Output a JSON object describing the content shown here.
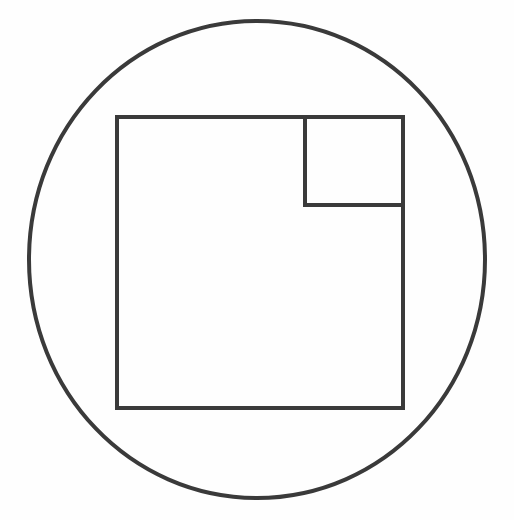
{
  "canvas": {
    "width": 514,
    "height": 520,
    "background_color": "#fefefe",
    "title": "Geometric line drawing: circle with inscribed squares"
  },
  "style": {
    "stroke_color": "#3a3a3a",
    "stroke_width": 4,
    "fill_color": "none",
    "interior_fill": "#fafafa"
  },
  "shapes": {
    "circle": {
      "name": "outer-circle",
      "type": "circle",
      "center_x": 257,
      "center_y": 259.5,
      "radius_x": 228,
      "radius_y": 238.5,
      "stroke_color": "#3a3a3a",
      "stroke_width": 4,
      "fill": "none",
      "path": "M 257 21 C 383 21 485 127 485 259.5 C 485 392 383 498 257 498 C 131 498 29 392 29 259.5 C 29 127 131 21 257 21 Z"
    },
    "large_square": {
      "name": "large-square",
      "type": "rect",
      "x": 117,
      "y": 117,
      "width": 286,
      "height": 291,
      "stroke_color": "#3a3a3a",
      "stroke_width": 4,
      "fill": "none"
    },
    "small_square": {
      "name": "small-square",
      "type": "rect",
      "x": 305,
      "y": 117,
      "width": 98,
      "height": 88,
      "stroke_color": "#3a3a3a",
      "stroke_width": 4,
      "fill": "none",
      "position_note": "nested in top-right corner of large square"
    }
  }
}
